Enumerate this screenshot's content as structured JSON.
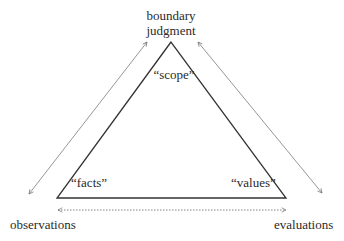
{
  "diagram": {
    "type": "triangle-concept-diagram",
    "apex_label": {
      "line1": "boundary",
      "line2": "judgment"
    },
    "inner_labels": {
      "top": "“scope”",
      "bottom_left": "“facts”",
      "bottom_right": "“values”"
    },
    "outer_labels": {
      "bottom_left": "observations",
      "bottom_right": "evaluations"
    },
    "arrows": [
      {
        "name": "left-diagonal",
        "from": "observations",
        "to": "boundary judgment",
        "style": "solid",
        "bidirectional": true
      },
      {
        "name": "right-diagonal",
        "from": "boundary judgment",
        "to": "evaluations",
        "style": "solid",
        "bidirectional": true
      },
      {
        "name": "bottom-horizontal",
        "from": "observations",
        "to": "evaluations",
        "style": "dotted",
        "bidirectional": true
      }
    ],
    "colors": {
      "triangle_stroke": "#333333",
      "arrow_stroke": "#8a8a8a",
      "text": "#2a2a2a",
      "background": "#ffffff"
    }
  }
}
